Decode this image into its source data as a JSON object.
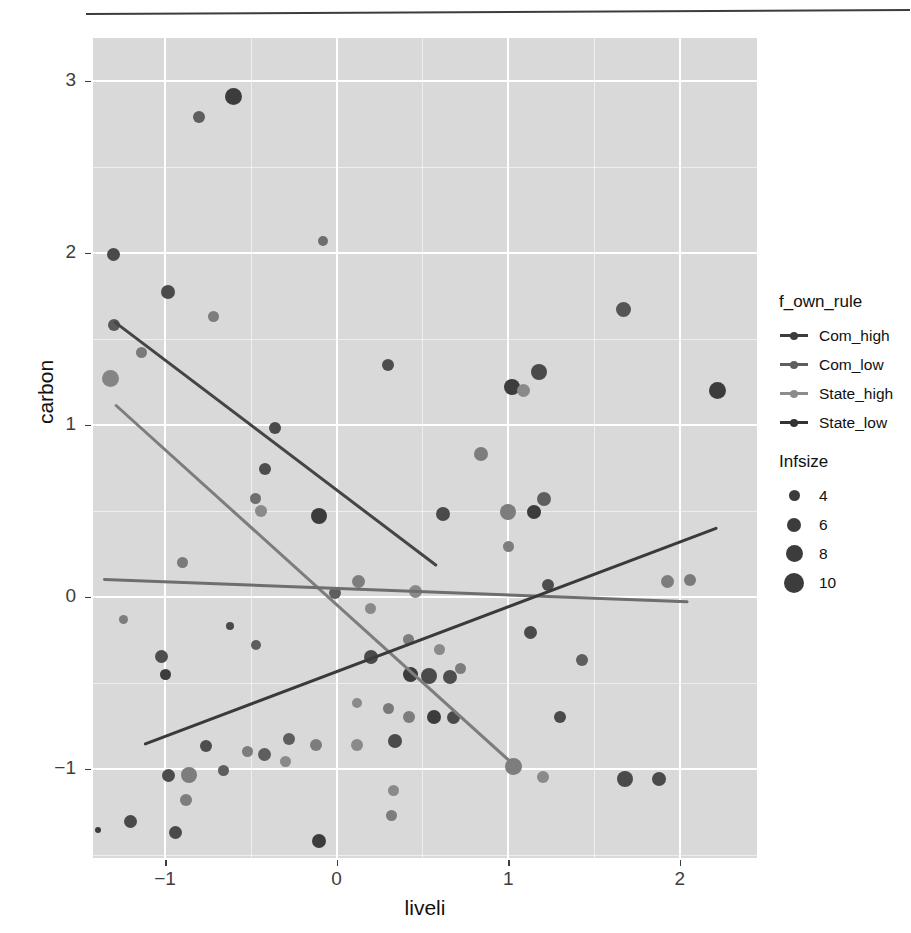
{
  "chart_data": {
    "type": "scatter",
    "title": "",
    "xlabel": "liveli",
    "ylabel": "carbon",
    "xlim": [
      -1.42,
      2.45
    ],
    "ylim": [
      -1.52,
      3.25
    ],
    "xticks": [
      -1,
      0,
      1,
      2
    ],
    "xtick_labels": [
      "−1",
      "0",
      "1",
      "2"
    ],
    "yticks": [
      -1,
      0,
      1,
      2,
      3
    ],
    "ytick_labels": [
      "−1",
      "0",
      "1",
      "2",
      "3"
    ],
    "grid": true,
    "panel_bg": "#d9d9d9",
    "grid_color": "#ffffff",
    "legend_position": "right",
    "color_legend": {
      "title": "f_own_rule",
      "entries": [
        {
          "label": "Com_high",
          "color": "#3c3c3c"
        },
        {
          "label": "Com_low",
          "color": "#5e5e5e"
        },
        {
          "label": "State_high",
          "color": "#8c8c8c"
        },
        {
          "label": "State_low",
          "color": "#333333"
        }
      ]
    },
    "size_legend": {
      "title": "Infsize",
      "entries": [
        {
          "label": "4",
          "size": 11
        },
        {
          "label": "6",
          "size": 14
        },
        {
          "label": "8",
          "size": 17
        },
        {
          "label": "10",
          "size": 20
        }
      ]
    },
    "fit_lines": [
      {
        "name": "Com_high",
        "color": "#454545",
        "x0": -1.3,
        "y0": 1.6,
        "x1": 0.58,
        "y1": 0.18
      },
      {
        "name": "State_high",
        "color": "#7d7d7d",
        "x0": -1.29,
        "y0": 1.12,
        "x1": 1.05,
        "y1": -0.99
      },
      {
        "name": "Com_low",
        "color": "#6e6e6e",
        "x0": -1.36,
        "y0": 0.1,
        "x1": 2.05,
        "y1": -0.03
      },
      {
        "name": "State_low",
        "color": "#3a3a3a",
        "x0": -1.12,
        "y0": -0.86,
        "x1": 2.22,
        "y1": 0.4
      }
    ],
    "points": [
      {
        "x": -0.6,
        "y": 2.91,
        "size": 17,
        "color": "#3c3c3c"
      },
      {
        "x": -0.8,
        "y": 2.79,
        "size": 12,
        "color": "#5e5e5e"
      },
      {
        "x": -0.08,
        "y": 2.07,
        "size": 10,
        "color": "#6e6e6e"
      },
      {
        "x": -1.3,
        "y": 1.99,
        "size": 13,
        "color": "#4a4a4a"
      },
      {
        "x": -0.98,
        "y": 1.77,
        "size": 14,
        "color": "#4a4a4a"
      },
      {
        "x": -0.72,
        "y": 1.63,
        "size": 11,
        "color": "#7d7d7d"
      },
      {
        "x": -1.3,
        "y": 1.58,
        "size": 12,
        "color": "#5a5a5a"
      },
      {
        "x": -1.14,
        "y": 1.42,
        "size": 11,
        "color": "#7a7a7a"
      },
      {
        "x": -1.32,
        "y": 1.27,
        "size": 17,
        "color": "#858585"
      },
      {
        "x": 1.67,
        "y": 1.67,
        "size": 15,
        "color": "#555555"
      },
      {
        "x": 0.3,
        "y": 1.35,
        "size": 12,
        "color": "#4d4d4d"
      },
      {
        "x": 1.02,
        "y": 1.22,
        "size": 16,
        "color": "#3c3c3c"
      },
      {
        "x": 1.18,
        "y": 1.31,
        "size": 16,
        "color": "#4a4a4a"
      },
      {
        "x": 1.09,
        "y": 1.2,
        "size": 13,
        "color": "#8a8a8a"
      },
      {
        "x": 2.22,
        "y": 1.2,
        "size": 17,
        "color": "#3c3c3c"
      },
      {
        "x": -0.36,
        "y": 0.98,
        "size": 12,
        "color": "#4a4a4a"
      },
      {
        "x": 0.84,
        "y": 0.83,
        "size": 14,
        "color": "#7d7d7d"
      },
      {
        "x": -0.42,
        "y": 0.74,
        "size": 12,
        "color": "#4d4d4d"
      },
      {
        "x": -0.47,
        "y": 0.57,
        "size": 11,
        "color": "#6e6e6e"
      },
      {
        "x": -0.44,
        "y": 0.5,
        "size": 12,
        "color": "#8a8a8a"
      },
      {
        "x": -0.1,
        "y": 0.47,
        "size": 16,
        "color": "#3c3c3c"
      },
      {
        "x": 0.62,
        "y": 0.48,
        "size": 14,
        "color": "#4a4a4a"
      },
      {
        "x": 1.0,
        "y": 0.49,
        "size": 16,
        "color": "#7d7d7d"
      },
      {
        "x": 1.21,
        "y": 0.57,
        "size": 14,
        "color": "#5f5f5f"
      },
      {
        "x": 1.15,
        "y": 0.49,
        "size": 14,
        "color": "#3c3c3c"
      },
      {
        "x": 1.0,
        "y": 0.29,
        "size": 11,
        "color": "#7d7d7d"
      },
      {
        "x": -0.9,
        "y": 0.2,
        "size": 11,
        "color": "#7a7a7a"
      },
      {
        "x": 0.13,
        "y": 0.09,
        "size": 13,
        "color": "#7d7d7d"
      },
      {
        "x": 0.46,
        "y": 0.03,
        "size": 13,
        "color": "#8a8a8a"
      },
      {
        "x": 1.23,
        "y": 0.07,
        "size": 12,
        "color": "#4d4d4d"
      },
      {
        "x": 1.93,
        "y": 0.09,
        "size": 13,
        "color": "#7d7d7d"
      },
      {
        "x": 2.06,
        "y": 0.1,
        "size": 12,
        "color": "#7a7a7a"
      },
      {
        "x": -0.01,
        "y": 0.02,
        "size": 12,
        "color": "#5e5e5e"
      },
      {
        "x": 0.2,
        "y": -0.07,
        "size": 11,
        "color": "#8a8a8a"
      },
      {
        "x": 1.13,
        "y": -0.21,
        "size": 13,
        "color": "#4a4a4a"
      },
      {
        "x": -1.24,
        "y": -0.13,
        "size": 9,
        "color": "#7d7d7d"
      },
      {
        "x": -0.62,
        "y": -0.17,
        "size": 8,
        "color": "#4a4a4a"
      },
      {
        "x": -0.47,
        "y": -0.28,
        "size": 10,
        "color": "#5e5e5e"
      },
      {
        "x": 0.42,
        "y": -0.25,
        "size": 11,
        "color": "#7d7d7d"
      },
      {
        "x": 0.6,
        "y": -0.31,
        "size": 11,
        "color": "#8a8a8a"
      },
      {
        "x": 0.2,
        "y": -0.35,
        "size": 14,
        "color": "#4a4a4a"
      },
      {
        "x": 1.43,
        "y": -0.37,
        "size": 12,
        "color": "#5e5e5e"
      },
      {
        "x": -1.02,
        "y": -0.35,
        "size": 13,
        "color": "#4d4d4d"
      },
      {
        "x": -1.0,
        "y": -0.45,
        "size": 11,
        "color": "#3c3c3c"
      },
      {
        "x": 0.43,
        "y": -0.45,
        "size": 15,
        "color": "#3c3c3c"
      },
      {
        "x": 0.54,
        "y": -0.46,
        "size": 16,
        "color": "#4a4a4a"
      },
      {
        "x": 0.66,
        "y": -0.47,
        "size": 14,
        "color": "#4d4d4d"
      },
      {
        "x": 0.72,
        "y": -0.42,
        "size": 11,
        "color": "#7d7d7d"
      },
      {
        "x": 0.12,
        "y": -0.62,
        "size": 10,
        "color": "#8a8a8a"
      },
      {
        "x": 0.3,
        "y": -0.65,
        "size": 11,
        "color": "#7a7a7a"
      },
      {
        "x": 0.42,
        "y": -0.7,
        "size": 12,
        "color": "#7d7d7d"
      },
      {
        "x": 0.57,
        "y": -0.7,
        "size": 14,
        "color": "#3c3c3c"
      },
      {
        "x": 0.68,
        "y": -0.7,
        "size": 13,
        "color": "#4a4a4a"
      },
      {
        "x": 1.3,
        "y": -0.7,
        "size": 12,
        "color": "#4a4a4a"
      },
      {
        "x": -0.28,
        "y": -0.83,
        "size": 12,
        "color": "#5e5e5e"
      },
      {
        "x": -0.12,
        "y": -0.86,
        "size": 12,
        "color": "#7d7d7d"
      },
      {
        "x": 0.12,
        "y": -0.86,
        "size": 12,
        "color": "#8a8a8a"
      },
      {
        "x": 0.34,
        "y": -0.84,
        "size": 14,
        "color": "#4a4a4a"
      },
      {
        "x": -0.76,
        "y": -0.87,
        "size": 12,
        "color": "#4d4d4d"
      },
      {
        "x": -0.52,
        "y": -0.9,
        "size": 11,
        "color": "#7d7d7d"
      },
      {
        "x": -0.42,
        "y": -0.92,
        "size": 13,
        "color": "#5e5e5e"
      },
      {
        "x": -0.3,
        "y": -0.96,
        "size": 11,
        "color": "#8a8a8a"
      },
      {
        "x": 1.03,
        "y": -0.99,
        "size": 17,
        "color": "#7d7d7d"
      },
      {
        "x": 1.2,
        "y": -1.05,
        "size": 12,
        "color": "#8a8a8a"
      },
      {
        "x": -0.86,
        "y": -1.04,
        "size": 16,
        "color": "#7d7d7d"
      },
      {
        "x": -0.98,
        "y": -1.04,
        "size": 13,
        "color": "#4a4a4a"
      },
      {
        "x": -0.66,
        "y": -1.01,
        "size": 11,
        "color": "#5e5e5e"
      },
      {
        "x": -0.88,
        "y": -1.18,
        "size": 12,
        "color": "#7d7d7d"
      },
      {
        "x": 1.68,
        "y": -1.06,
        "size": 16,
        "color": "#4a4a4a"
      },
      {
        "x": 1.88,
        "y": -1.06,
        "size": 14,
        "color": "#4a4a4a"
      },
      {
        "x": -1.2,
        "y": -1.31,
        "size": 13,
        "color": "#4a4a4a"
      },
      {
        "x": -1.39,
        "y": -1.36,
        "size": 6,
        "color": "#3c3c3c"
      },
      {
        "x": -0.94,
        "y": -1.37,
        "size": 13,
        "color": "#4a4a4a"
      },
      {
        "x": -0.1,
        "y": -1.42,
        "size": 14,
        "color": "#3c3c3c"
      },
      {
        "x": 0.32,
        "y": -1.27,
        "size": 11,
        "color": "#7d7d7d"
      },
      {
        "x": 0.33,
        "y": -1.13,
        "size": 11,
        "color": "#8a8a8a"
      }
    ]
  }
}
